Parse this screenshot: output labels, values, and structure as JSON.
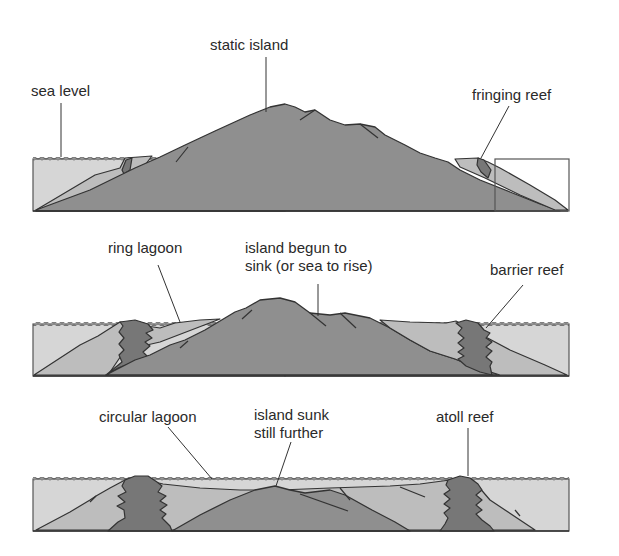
{
  "diagram": {
    "panels": [
      {
        "id": "stage-1",
        "labels": {
          "sea_level": "sea level",
          "island": "static island",
          "reef": "fringing reef"
        }
      },
      {
        "id": "stage-2",
        "labels": {
          "lagoon": "ring lagoon",
          "island_line1": "island begun to",
          "island_line2": "sink (or sea to rise)",
          "reef": "barrier reef"
        }
      },
      {
        "id": "stage-3",
        "labels": {
          "lagoon": "circular lagoon",
          "island_line1": "island sunk",
          "island_line2": "still further",
          "reef": "atoll reef"
        }
      }
    ],
    "colors": {
      "sea": "#d6d6d6",
      "island": "#8f8f8f",
      "reef": "#777777",
      "lagoon_slope": "#bdbdbd",
      "outline": "#333333"
    }
  }
}
